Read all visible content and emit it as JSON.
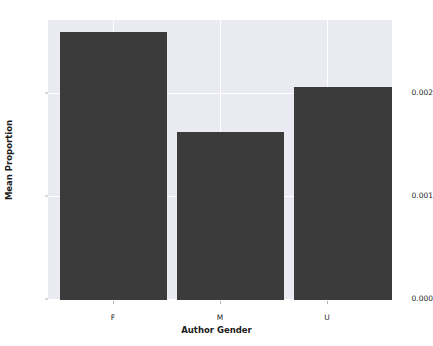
{
  "chart_data": {
    "type": "bar",
    "title": "",
    "xlabel": "Author Gender",
    "ylabel": "Mean Proportion",
    "categories": [
      "F",
      "M",
      "U"
    ],
    "values": [
      0.0026,
      0.00163,
      0.00207
    ],
    "series": [
      {
        "name": "Mean Proportion",
        "values": [
          0.0026,
          0.00163,
          0.00207
        ]
      }
    ],
    "ylim": [
      0.0,
      0.00272
    ],
    "yticks": [
      0.0,
      0.001,
      0.002
    ],
    "ytick_labels": [
      "0.000",
      "0.001",
      "0.002"
    ],
    "xtick_labels": [
      "F",
      "M",
      "U"
    ],
    "grid": true,
    "legend": "none",
    "bar_color": "#3b3b3b",
    "plot_background": "#eaeaf2",
    "figure_background": "#ffffff",
    "gridline_color": "#ffffff"
  }
}
